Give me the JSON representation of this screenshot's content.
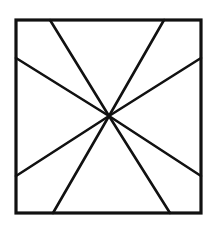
{
  "diagram": {
    "stroke_color": "#111111",
    "background": "#ffffff",
    "square": {
      "x1": 16,
      "y1": 20,
      "x2": 201,
      "y2": 213,
      "stroke_width": 3.2
    },
    "center": {
      "x": 109,
      "y": 116
    },
    "ray_stroke_width": 2.6,
    "rays": [
      {
        "name": "ray-top-left",
        "x": 50,
        "y": 20
      },
      {
        "name": "ray-top-right",
        "x": 164,
        "y": 20
      },
      {
        "name": "ray-right-upper",
        "x": 201,
        "y": 58
      },
      {
        "name": "ray-right-lower",
        "x": 201,
        "y": 176
      },
      {
        "name": "ray-bottom-right",
        "x": 170,
        "y": 213
      },
      {
        "name": "ray-bottom-left",
        "x": 53,
        "y": 213
      },
      {
        "name": "ray-left-lower",
        "x": 16,
        "y": 176
      },
      {
        "name": "ray-left-upper",
        "x": 16,
        "y": 58
      }
    ]
  }
}
